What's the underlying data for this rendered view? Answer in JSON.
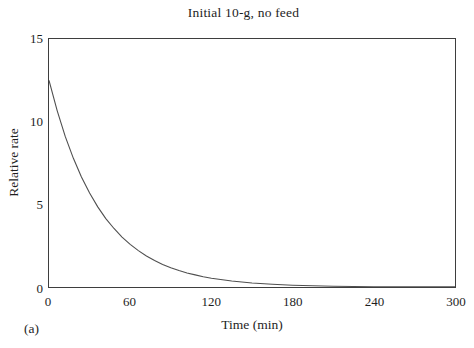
{
  "figure": {
    "panel_label": "(a)"
  },
  "colors": {
    "background": "#ffffff",
    "frame": "#3e3e3e",
    "curve": "#4f4f4f",
    "text": "#1e1e1e"
  },
  "chart_data": {
    "type": "line",
    "title": "Initial 10-g, no feed",
    "xlabel": "Time (min)",
    "ylabel": "Relative rate",
    "xlim": [
      0,
      300
    ],
    "ylim": [
      0,
      15
    ],
    "xticks": [
      0,
      60,
      120,
      180,
      240,
      300
    ],
    "yticks": [
      0,
      5,
      10,
      15
    ],
    "grid": false,
    "legend": "none",
    "series": [
      {
        "name": "relative-rate-decay",
        "x": [
          0,
          6,
          12,
          18,
          24,
          30,
          36,
          42,
          48,
          54,
          60,
          66,
          72,
          78,
          84,
          90,
          96,
          102,
          108,
          114,
          120,
          135,
          150,
          165,
          180,
          210,
          240,
          270,
          300
        ],
        "y": [
          12.5,
          10.67,
          9.11,
          7.78,
          6.65,
          5.68,
          4.85,
          4.14,
          3.54,
          3.02,
          2.58,
          2.2,
          1.88,
          1.61,
          1.37,
          1.17,
          1.0,
          0.85,
          0.73,
          0.62,
          0.53,
          0.36,
          0.24,
          0.16,
          0.11,
          0.05,
          0.02,
          0.01,
          0.005
        ]
      }
    ]
  }
}
